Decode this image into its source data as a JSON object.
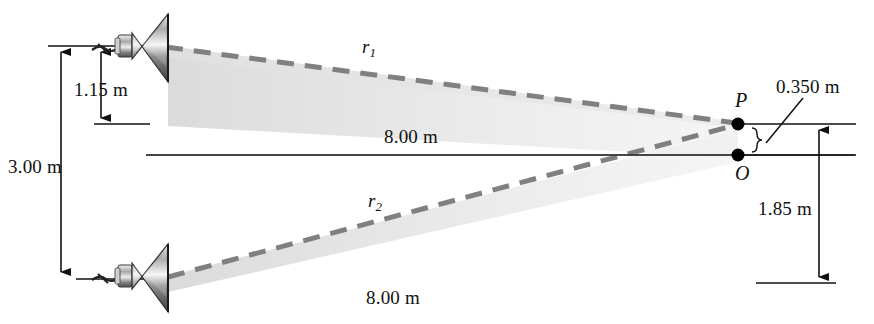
{
  "figure": {
    "background_color": "#ffffff",
    "line_color": "#111111",
    "beam_color": "#8a8a8a",
    "shade_color": "#e9e9e9"
  },
  "labels": {
    "height_total": "3.00 m",
    "height_upper": "1.15 m",
    "height_lower": "1.85 m",
    "offset_po": "0.350 m",
    "distance_top": "8.00 m",
    "distance_bottom": "8.00 m",
    "point_p": "P",
    "point_o": "O",
    "ray_top_base": "r",
    "ray_top_sub": "1",
    "ray_bottom_base": "r",
    "ray_bottom_sub": "2"
  },
  "elements": {
    "speaker_top": "speaker-top",
    "speaker_bottom": "speaker-bottom",
    "dot_p": "point-p-dot",
    "dot_o": "point-o-dot",
    "axis_line": "central-axis-line"
  },
  "geometry": {
    "speaker_top_xy": [
      155,
      48
    ],
    "speaker_bottom_xy": [
      155,
      278
    ],
    "point_p_xy": [
      738,
      124
    ],
    "point_o_xy": [
      738,
      155
    ]
  }
}
